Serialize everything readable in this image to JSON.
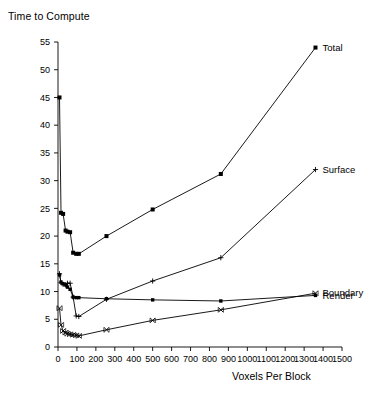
{
  "chart_data": {
    "type": "line",
    "title": "Time to Compute",
    "xlabel": "Voxels Per Block",
    "ylabel": "Time to Compute",
    "xlim": [
      0,
      1500
    ],
    "ylim": [
      0,
      55
    ],
    "xticks": [
      0,
      100,
      200,
      300,
      400,
      500,
      600,
      700,
      800,
      900,
      1000,
      1100,
      1200,
      1300,
      1400,
      1500
    ],
    "yticks": [
      0,
      5,
      10,
      15,
      20,
      25,
      30,
      35,
      40,
      45,
      50,
      55
    ],
    "xticklabels": [
      "0",
      "100",
      "200",
      "300",
      "400",
      "500",
      "600",
      "700",
      "800",
      "900",
      "1000",
      "1100",
      "1200",
      "1300",
      "1400",
      "1500"
    ],
    "yticklabels": [
      "0",
      "5",
      "10",
      "15",
      "20",
      "25",
      "30",
      "35",
      "40",
      "45",
      "50",
      "55"
    ],
    "grid": false,
    "legend_position": "right-inline-labels",
    "series": [
      {
        "name": "Total",
        "marker": "filled-square",
        "x": [
          8,
          16,
          27,
          40,
          50,
          64,
          80,
          96,
          110,
          256,
          500,
          860,
          1360
        ],
        "y": [
          45.0,
          24.2,
          24.0,
          21.0,
          20.8,
          20.7,
          17.0,
          16.8,
          16.8,
          20.0,
          24.8,
          31.2,
          54.0
        ]
      },
      {
        "name": "Surface",
        "marker": "plus",
        "x": [
          8,
          16,
          27,
          40,
          50,
          64,
          80,
          96,
          110,
          256,
          500,
          860,
          1360
        ],
        "y": [
          13.2,
          11.6,
          11.3,
          11.2,
          11.5,
          11.5,
          9.0,
          5.6,
          5.5,
          8.6,
          11.9,
          16.1,
          32.0
        ]
      },
      {
        "name": "Boundary",
        "marker": "x-cross",
        "x": [
          8,
          16,
          27,
          40,
          50,
          64,
          80,
          96,
          110,
          256,
          500,
          860,
          1360
        ],
        "y": [
          7.0,
          4.0,
          2.9,
          2.6,
          2.4,
          2.3,
          2.2,
          2.1,
          2.0,
          3.1,
          4.8,
          6.7,
          9.7
        ],
        "note": "lowest curve at left-cluster, rises steadily to right"
      },
      {
        "name": "Render",
        "marker": "filled-square-small",
        "x": [
          8,
          16,
          27,
          40,
          50,
          64,
          80,
          96,
          110,
          256,
          500,
          860,
          1360
        ],
        "y": [
          13.0,
          11.7,
          11.4,
          11.2,
          10.8,
          10.4,
          9.0,
          8.9,
          8.9,
          8.7,
          8.5,
          8.3,
          9.3
        ],
        "note": "nearly flat near 8.5-9 across the full range"
      }
    ],
    "series_labels": [
      {
        "name": "Total",
        "label": "Total"
      },
      {
        "name": "Surface",
        "label": "Surface"
      },
      {
        "name": "Boundary",
        "label": "Boundary"
      },
      {
        "name": "Render",
        "label": "Render"
      }
    ],
    "colors": {
      "line": "#000000",
      "axis": "#000000",
      "background": "#ffffff"
    }
  }
}
